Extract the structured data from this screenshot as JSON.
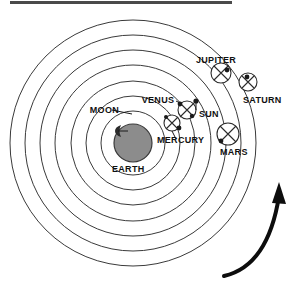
{
  "figure": {
    "top_rule_color": "#4a4a4a",
    "background": "#ffffff",
    "stroke_color": "#3a3a3a",
    "earth_fill": "#8c8c8c"
  },
  "center": {
    "label": "EARTH",
    "cx": 133,
    "cy": 143,
    "r": 19
  },
  "moon": {
    "label": "MOON",
    "label_x": 93,
    "label_y": 110
  },
  "orbits": [
    {
      "name": "moon-orbit",
      "r": 17
    },
    {
      "name": "mercury-orbit",
      "r": 32
    },
    {
      "name": "venus-orbit",
      "r": 47
    },
    {
      "name": "sun-orbit",
      "r": 62
    },
    {
      "name": "mars-orbit",
      "r": 78
    },
    {
      "name": "jupiter-orbit",
      "r": 93
    },
    {
      "name": "saturn-orbit",
      "r": 108
    },
    {
      "name": "outer-sphere",
      "r": 123
    }
  ],
  "bodies": [
    {
      "name": "mercury",
      "label": "MERCURY",
      "cx": 172,
      "cy": 123,
      "epi_r": 8,
      "label_x": 149,
      "label_y": 140,
      "leader": true
    },
    {
      "name": "venus",
      "label": "VENUS",
      "cx": 187,
      "cy": 110,
      "epi_r": 9,
      "label_x": 156,
      "label_y": 101,
      "leader": true
    },
    {
      "name": "sun",
      "label": "SUN",
      "cx": 196,
      "cy": 110,
      "epi_r": 0,
      "label_x": 200,
      "label_y": 116,
      "leader": false
    },
    {
      "name": "mars",
      "label": "MARS",
      "cx": 228,
      "cy": 134,
      "epi_r": 11,
      "label_x": 218,
      "label_y": 154,
      "leader": false
    },
    {
      "name": "jupiter",
      "label": "JUPITER",
      "cx": 221,
      "cy": 73,
      "epi_r": 10,
      "label_x": 196,
      "label_y": 62,
      "leader": false
    },
    {
      "name": "saturn",
      "label": "SATURN",
      "cx": 248,
      "cy": 82,
      "epi_r": 9,
      "label_x": 243,
      "label_y": 102,
      "leader": false
    }
  ],
  "direction_arrow": {
    "name": "rotation-direction-arrow",
    "meaning": "counter-clockwise motion of the spheres"
  },
  "labels": {
    "earth": "EARTH",
    "moon": "MOON",
    "mercury": "MERCURY",
    "venus": "VENUS",
    "sun": "SUN",
    "mars": "MARS",
    "jupiter": "JUPITER",
    "saturn": "SATURN"
  }
}
